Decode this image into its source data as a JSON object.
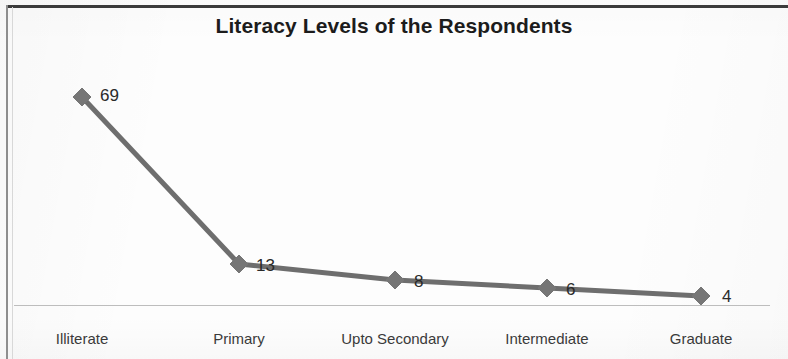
{
  "chart_data": {
    "type": "line",
    "title": "Literacy Levels of the Respondents",
    "xlabel": "",
    "ylabel": "",
    "categories": [
      "Illiterate",
      "Primary",
      "Upto Secondary",
      "Intermediate",
      "Graduate"
    ],
    "values": [
      69,
      13,
      8,
      6,
      4
    ],
    "value_labels": [
      "69",
      "13",
      "8",
      "6",
      "4"
    ],
    "series": [
      {
        "name": "Literacy Levels",
        "values": [
          69,
          13,
          8,
          6,
          4
        ]
      }
    ],
    "ylim": [
      0,
      75
    ],
    "grid": false,
    "legend": "none",
    "marker": "diamond",
    "line_color": "#6e6e6e",
    "marker_color": "#767676",
    "axis_color": "#bdbdbd",
    "title_color": "#1c1c1c",
    "label_color": "#2a2a2a",
    "category_label_color": "#3a3a3a",
    "points": [
      {
        "category": "Illiterate",
        "value": 69,
        "label": "69",
        "x": 82,
        "y": 97,
        "label_x": 100,
        "label_y": 86
      },
      {
        "category": "Primary",
        "value": 13,
        "label": "13",
        "x": 239,
        "y": 264,
        "label_x": 256,
        "label_y": 256
      },
      {
        "category": "Upto Secondary",
        "value": 8,
        "label": "8",
        "x": 395,
        "y": 280,
        "label_x": 414,
        "label_y": 272
      },
      {
        "category": "Intermediate",
        "value": 6,
        "label": "6",
        "x": 547,
        "y": 288,
        "label_x": 566,
        "label_y": 280
      },
      {
        "category": "Graduate",
        "value": 4,
        "label": "4",
        "x": 701,
        "y": 296,
        "label_x": 722,
        "label_y": 287
      }
    ],
    "category_positions": [
      82,
      239,
      395,
      547,
      701
    ]
  }
}
